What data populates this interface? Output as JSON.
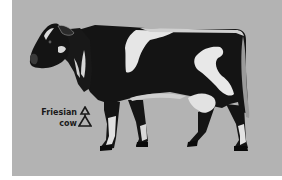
{
  "image": {
    "subject": "cow-illustration",
    "background_color": "#b3b3b3"
  },
  "label": {
    "line1": "Friesian",
    "line2": "cow"
  },
  "symbol": {
    "icon": "stacked-triangles-icon"
  },
  "colors": {
    "coat_dark": "#141414",
    "coat_light": "#e8e8e8",
    "text": "#1a1a1a"
  }
}
